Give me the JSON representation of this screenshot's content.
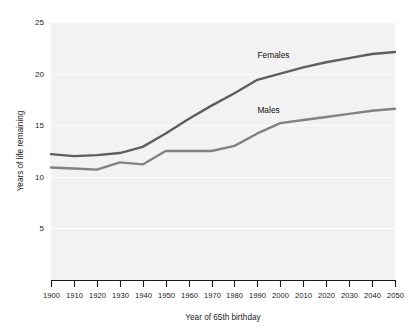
{
  "chart_data": {
    "type": "line",
    "title": "",
    "xlabel": "Year of 65th birthday",
    "ylabel": "Years of life remaining",
    "xlim": [
      1900,
      2050
    ],
    "ylim": [
      0,
      25
    ],
    "grid": true,
    "grid_axis": "y",
    "legend_position": "inline-annotations",
    "x": [
      1900,
      1910,
      1920,
      1930,
      1940,
      1950,
      1960,
      1970,
      1980,
      1990,
      2000,
      2010,
      2020,
      2030,
      2040,
      2050
    ],
    "xticks": [
      "1900",
      "1910",
      "1920",
      "1930",
      "1940",
      "1950",
      "1960",
      "1970",
      "1980",
      "1990",
      "2000",
      "2010",
      "2020",
      "2030",
      "2040",
      "2050"
    ],
    "yticks": [
      "5",
      "10",
      "15",
      "20",
      "25"
    ],
    "ytick_values": [
      5,
      10,
      15,
      20,
      25
    ],
    "series": [
      {
        "name": "Females",
        "color": "#5e5e5e",
        "values": [
          12.2,
          12.0,
          12.1,
          12.3,
          12.9,
          14.2,
          15.6,
          16.9,
          18.1,
          19.4,
          20.0,
          20.6,
          21.1,
          21.5,
          21.9,
          22.1
        ],
        "label_text": "Females"
      },
      {
        "name": "Males",
        "color": "#828282",
        "values": [
          10.9,
          10.8,
          10.7,
          11.4,
          11.2,
          12.5,
          12.5,
          12.5,
          13.0,
          14.2,
          15.2,
          15.5,
          15.8,
          16.1,
          16.4,
          16.6
        ],
        "label_text": "Males"
      }
    ],
    "annotations": [
      {
        "text": "Females",
        "x": 1990,
        "y": 21.5
      },
      {
        "text": "Males",
        "x": 1990,
        "y": 16.2
      }
    ]
  },
  "axes": {
    "y_axis_title": "Years of life remaining",
    "x_axis_title": "Year of 65th birthday"
  },
  "colors": {
    "plot_background": "#f2f2f2",
    "page_background": "#ffffff",
    "gridline": "#ffffff",
    "axis": "#1a1a1a",
    "females_line": "#5e5e5e",
    "males_line": "#828282"
  }
}
